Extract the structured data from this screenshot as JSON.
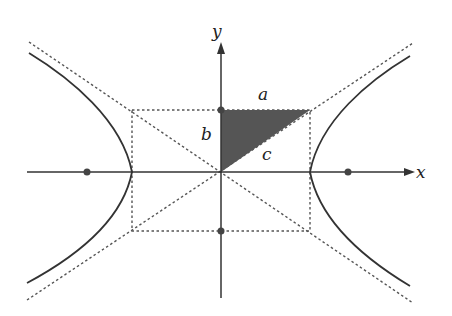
{
  "figure": {
    "labels": {
      "x_axis": "x",
      "y_axis": "y",
      "side_a": "a",
      "side_b": "b",
      "hypotenuse_c": "c"
    },
    "colors": {
      "line": "#333333",
      "dotted": "#555555",
      "shade": "#555555",
      "point": "#444444"
    },
    "geometry": {
      "center": [
        221,
        172
      ],
      "a_px": 89,
      "b_px": 62,
      "foci_x": [
        87,
        348
      ],
      "vertices_x": [
        132,
        310
      ],
      "covertex_y": [
        110,
        231
      ]
    }
  }
}
